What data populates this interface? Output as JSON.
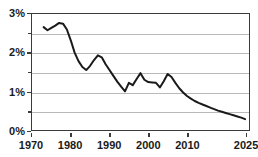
{
  "chart_data": {
    "type": "line",
    "title": "",
    "xlabel": "",
    "ylabel": "",
    "xlim": [
      1970,
      2026
    ],
    "ylim": [
      0,
      3
    ],
    "grid": true,
    "grid_interval": 0.5,
    "legend": "none",
    "y_tick_labels": [
      "3%",
      "2%",
      "1%",
      "0%"
    ],
    "y_tick_values": [
      3,
      2,
      1,
      0
    ],
    "y_minor_values": [
      2.5,
      1.5,
      0.5
    ],
    "x_tick_labels": [
      "1970",
      "1980",
      "1990",
      "2000",
      "2010",
      "2025"
    ],
    "x_tick_values": [
      1970,
      1980,
      1990,
      2000,
      2010,
      2025
    ],
    "series": [
      {
        "name": "rate",
        "color": "#1a1a1a",
        "x": [
          1973,
          1974,
          1975,
          1976,
          1977,
          1978,
          1979,
          1980,
          1981,
          1982,
          1983,
          1984,
          1985,
          1986,
          1987,
          1988,
          1989,
          1990,
          1991,
          1992,
          1993,
          1994,
          1995,
          1996,
          1997,
          1998,
          1999,
          2000,
          2001,
          2002,
          2003,
          2004,
          2005,
          2006,
          2007,
          2008,
          2009,
          2010,
          2011,
          2012,
          2013,
          2014,
          2015,
          2016,
          2017,
          2018,
          2019,
          2020,
          2021,
          2022,
          2023,
          2024,
          2025
        ],
        "values": [
          2.66,
          2.58,
          2.64,
          2.7,
          2.77,
          2.75,
          2.6,
          2.32,
          2.0,
          1.78,
          1.63,
          1.55,
          1.66,
          1.81,
          1.93,
          1.88,
          1.7,
          1.55,
          1.4,
          1.25,
          1.12,
          1.0,
          1.22,
          1.16,
          1.32,
          1.47,
          1.3,
          1.24,
          1.23,
          1.22,
          1.1,
          1.26,
          1.45,
          1.37,
          1.22,
          1.08,
          0.97,
          0.88,
          0.81,
          0.75,
          0.7,
          0.66,
          0.62,
          0.58,
          0.54,
          0.5,
          0.47,
          0.44,
          0.41,
          0.38,
          0.35,
          0.32,
          0.28
        ]
      }
    ]
  }
}
